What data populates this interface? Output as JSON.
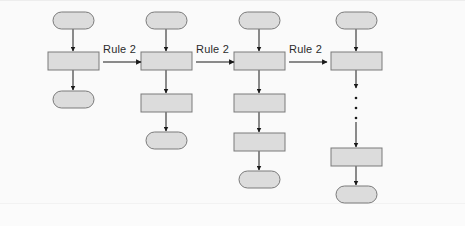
{
  "diagram": {
    "background_color": "#fafafa",
    "node_fill_color": "#dcdcdc",
    "node_stroke_color": "#7a7a7a",
    "arrow_color": "#1a1a1a",
    "text_color": "#2b2b2b",
    "rule_labels": [
      {
        "text": "Rule 2",
        "x": 103,
        "y": 43
      },
      {
        "text": "Rule 2",
        "x": 196,
        "y": 43
      },
      {
        "text": "Rule 2",
        "x": 289,
        "y": 43
      }
    ],
    "transition_arrows": [
      {
        "name": "rule-arrow-1",
        "x1": 103,
        "y1": 62,
        "x2": 141,
        "y2": 62
      },
      {
        "name": "rule-arrow-2",
        "x1": 196,
        "y1": 62,
        "x2": 234,
        "y2": 62
      },
      {
        "name": "rule-arrow-3",
        "x1": 289,
        "y1": 62,
        "x2": 327,
        "y2": 62
      }
    ],
    "columns": [
      {
        "name": "derivation-step-1",
        "index": 1,
        "center_x": 73,
        "node_count": 3,
        "nodes": [
          {
            "name": "start-node",
            "shape": "stadium",
            "x": 53,
            "y": 12,
            "w": 41,
            "h": 17
          },
          {
            "name": "process-node",
            "shape": "rectangle",
            "x": 48,
            "y": 52,
            "w": 51,
            "h": 18
          },
          {
            "name": "end-node",
            "shape": "stadium",
            "x": 53,
            "y": 91,
            "w": 41,
            "h": 17
          }
        ],
        "edges": [
          {
            "name": "edge-down",
            "x": 73,
            "y1": 29,
            "y2": 51
          },
          {
            "name": "edge-down",
            "x": 73,
            "y1": 70,
            "y2": 90
          }
        ],
        "ellipsis": null
      },
      {
        "name": "derivation-step-2",
        "index": 2,
        "center_x": 166,
        "node_count": 4,
        "nodes": [
          {
            "name": "start-node",
            "shape": "stadium",
            "x": 146,
            "y": 12,
            "w": 41,
            "h": 17
          },
          {
            "name": "process-node",
            "shape": "rectangle",
            "x": 141,
            "y": 52,
            "w": 51,
            "h": 18
          },
          {
            "name": "process-node",
            "shape": "rectangle",
            "x": 141,
            "y": 94,
            "w": 51,
            "h": 18
          },
          {
            "name": "end-node",
            "shape": "stadium",
            "x": 146,
            "y": 132,
            "w": 41,
            "h": 17
          }
        ],
        "edges": [
          {
            "name": "edge-down",
            "x": 166,
            "y1": 29,
            "y2": 51
          },
          {
            "name": "edge-down",
            "x": 166,
            "y1": 70,
            "y2": 93
          },
          {
            "name": "edge-down",
            "x": 166,
            "y1": 112,
            "y2": 131
          }
        ],
        "ellipsis": null
      },
      {
        "name": "derivation-step-3",
        "index": 3,
        "center_x": 259,
        "node_count": 5,
        "nodes": [
          {
            "name": "start-node",
            "shape": "stadium",
            "x": 239,
            "y": 12,
            "w": 41,
            "h": 17
          },
          {
            "name": "process-node",
            "shape": "rectangle",
            "x": 234,
            "y": 52,
            "w": 51,
            "h": 18
          },
          {
            "name": "process-node",
            "shape": "rectangle",
            "x": 234,
            "y": 94,
            "w": 51,
            "h": 18
          },
          {
            "name": "process-node",
            "shape": "rectangle",
            "x": 234,
            "y": 133,
            "w": 51,
            "h": 18
          },
          {
            "name": "end-node",
            "shape": "stadium",
            "x": 239,
            "y": 171,
            "w": 41,
            "h": 17
          }
        ],
        "edges": [
          {
            "name": "edge-down",
            "x": 259,
            "y1": 29,
            "y2": 51
          },
          {
            "name": "edge-down",
            "x": 259,
            "y1": 70,
            "y2": 93
          },
          {
            "name": "edge-down",
            "x": 259,
            "y1": 112,
            "y2": 132
          },
          {
            "name": "edge-down",
            "x": 259,
            "y1": 151,
            "y2": 170
          }
        ],
        "ellipsis": null
      },
      {
        "name": "derivation-step-n",
        "index": 4,
        "center_x": 356,
        "node_count": 4,
        "nodes": [
          {
            "name": "start-node",
            "shape": "stadium",
            "x": 336,
            "y": 12,
            "w": 41,
            "h": 17
          },
          {
            "name": "process-node",
            "shape": "rectangle",
            "x": 331,
            "y": 52,
            "w": 51,
            "h": 18
          },
          {
            "name": "process-node",
            "shape": "rectangle",
            "x": 331,
            "y": 148,
            "w": 51,
            "h": 18
          },
          {
            "name": "end-node",
            "shape": "stadium",
            "x": 336,
            "y": 186,
            "w": 41,
            "h": 17
          }
        ],
        "edges": [
          {
            "name": "edge-down",
            "x": 356,
            "y1": 29,
            "y2": 51
          },
          {
            "name": "edge-down",
            "x": 356,
            "y1": 70,
            "y2": 88
          },
          {
            "name": "edge-down",
            "x": 356,
            "y1": 122,
            "y2": 147
          },
          {
            "name": "edge-down",
            "x": 356,
            "y1": 166,
            "y2": 185
          }
        ],
        "ellipsis": {
          "name": "vertical-ellipsis",
          "x": 356,
          "dots": [
            98,
            108,
            118
          ],
          "radius": 1.3
        }
      }
    ]
  }
}
